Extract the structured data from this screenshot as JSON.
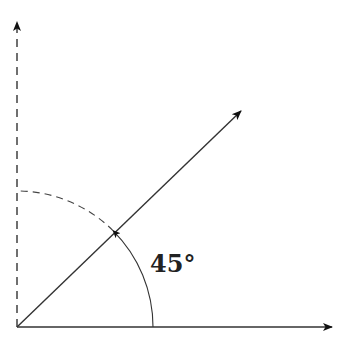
{
  "diagram": {
    "title": "",
    "angle_label": "45°",
    "angle_degrees": 45,
    "colors": {
      "stroke": "#333333",
      "arrowhead": "#111111",
      "label": "#222222",
      "background": "#ffffff"
    },
    "elements": [
      {
        "name": "horizontal-axis-arrow",
        "style": "solid"
      },
      {
        "name": "vertical-axis-arrow",
        "style": "dashed"
      },
      {
        "name": "diagonal-ray-arrow",
        "style": "solid",
        "angle": 45
      },
      {
        "name": "angle-arc",
        "style": "solid",
        "from": 0,
        "to": 45,
        "arrow": "at 45"
      },
      {
        "name": "reference-arc",
        "style": "dashed",
        "from": 45,
        "to": 90
      }
    ]
  }
}
